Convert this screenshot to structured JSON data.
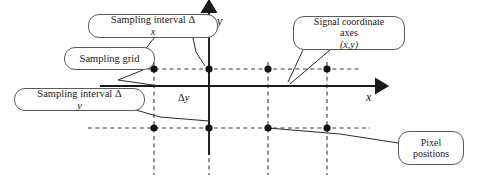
{
  "figure": {
    "type": "diagram",
    "background_color": "#ffffff",
    "line_color": "#1a1a1a",
    "callout_border_color": "#5a5a5a"
  },
  "axes": {
    "y_label": "y",
    "x_label": "x",
    "origin": {
      "x": 209,
      "y": 86
    },
    "x_axis": {
      "start_x": 100,
      "end_x": 378,
      "y": 86,
      "arrow": "right"
    },
    "y_axis": {
      "x": 209,
      "start_y": 155,
      "end_y": 10,
      "arrow": "up"
    }
  },
  "callouts": [
    {
      "id": "sampling-interval-dx",
      "lines": [
        "Sampling interval Δx"
      ],
      "box": {
        "x": 88,
        "y": 14,
        "w": 130,
        "h": 24
      },
      "font_size": 10.5
    },
    {
      "id": "sampling-grid",
      "lines": [
        "Sampling grid"
      ],
      "box": {
        "x": 64,
        "y": 47,
        "w": 91,
        "h": 23
      },
      "font_size": 10.5
    },
    {
      "id": "sampling-interval-dy",
      "lines": [
        "Sampling interval Δy"
      ],
      "box": {
        "x": 14,
        "y": 88,
        "w": 131,
        "h": 23
      },
      "font_size": 10.5
    },
    {
      "id": "signal-coordinate-axes",
      "lines": [
        "Signal coordinate",
        "axes (x,y)"
      ],
      "box": {
        "x": 293,
        "y": 16,
        "w": 112,
        "h": 34
      },
      "font_size": 10
    },
    {
      "id": "pixel-positions",
      "lines": [
        "Pixel",
        "positions"
      ],
      "box": {
        "x": 398,
        "y": 131,
        "w": 66,
        "h": 34
      },
      "font_size": 10
    }
  ],
  "inline_labels": {
    "delta_y": "Δy",
    "delta_y_pos": {
      "x": 178,
      "y": 92
    }
  },
  "grid": {
    "column_x": [
      154,
      209,
      268,
      327
    ],
    "row_y": [
      69,
      128
    ],
    "horizontal_dashed_lines": [
      {
        "y": 69,
        "x1": 140,
        "x2": 360
      },
      {
        "y": 128,
        "x1": 88,
        "x2": 370
      }
    ],
    "vertical_dashed_lines": [
      {
        "x": 154,
        "y1": 62,
        "y2": 175
      },
      {
        "x": 209,
        "y1": 62,
        "y2": 175
      },
      {
        "x": 268,
        "y1": 62,
        "y2": 175
      },
      {
        "x": 327,
        "y1": 62,
        "y2": 175
      }
    ],
    "dot_radius": 3.6
  },
  "pixel_positions": [
    {
      "x": 154,
      "y": 69
    },
    {
      "x": 209,
      "y": 69
    },
    {
      "x": 268,
      "y": 69
    },
    {
      "x": 327,
      "y": 69
    },
    {
      "x": 154,
      "y": 128
    },
    {
      "x": 209,
      "y": 128
    },
    {
      "x": 268,
      "y": 128
    },
    {
      "x": 327,
      "y": 128
    }
  ],
  "leader_lines": [
    {
      "id": "leader-sampling-interval-dx",
      "points": "193,38 196,52 205,66"
    },
    {
      "id": "leader-sampling-interval-dx-2",
      "points": "154,38 140,56 150,67"
    },
    {
      "id": "leader-sampling-grid",
      "points": "143,70 118,80 160,86"
    },
    {
      "id": "leader-sampling-interval-dy",
      "points": "136,110 160,117 209,121"
    },
    {
      "id": "leader-signal-axes-1",
      "points": "303,50 288,82"
    },
    {
      "id": "leader-signal-axes-2",
      "points": "330,50 290,84"
    },
    {
      "id": "leader-pixel-positions",
      "points": "398,143 340,134 268,128"
    }
  ]
}
